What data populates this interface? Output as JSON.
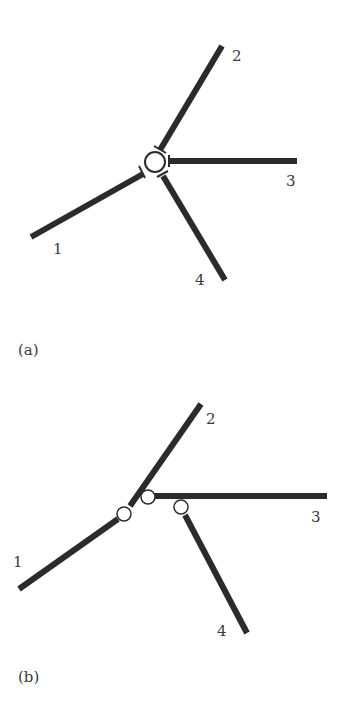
{
  "figures": [
    {
      "caption": "(a)",
      "description": "Four branches meeting at a single central junction node",
      "branches": [
        {
          "label": "1"
        },
        {
          "label": "2"
        },
        {
          "label": "3"
        },
        {
          "label": "4"
        }
      ],
      "nodes": 1
    },
    {
      "caption": "(b)",
      "description": "Four branches connected through three separate junction nodes",
      "branches": [
        {
          "label": "1"
        },
        {
          "label": "2"
        },
        {
          "label": "3"
        },
        {
          "label": "4"
        }
      ],
      "nodes": 3
    }
  ],
  "colors": {
    "branch": "#2b2b2b",
    "node_fill": "#ffffff",
    "node_stroke": "#2b2b2b",
    "text": "#3a3a3a"
  }
}
